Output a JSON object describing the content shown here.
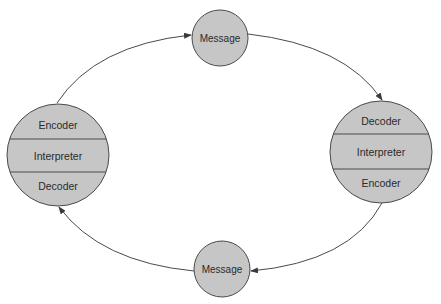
{
  "diagram": {
    "title": "",
    "colors": {
      "node_fill": "#c6c6c6",
      "stroke": "#4a4a4a",
      "text": "#2a2a2a",
      "background": "#ffffff"
    },
    "nodes": {
      "left_communicator": {
        "layers": [
          "Encoder",
          "Interpreter",
          "Decoder"
        ]
      },
      "right_communicator": {
        "layers": [
          "Decoder",
          "Interpreter",
          "Encoder"
        ]
      },
      "top_message": {
        "label": "Message"
      },
      "bottom_message": {
        "label": "Message"
      }
    },
    "edges": [
      {
        "from": "left_communicator",
        "to": "top_message"
      },
      {
        "from": "top_message",
        "to": "right_communicator"
      },
      {
        "from": "right_communicator",
        "to": "bottom_message"
      },
      {
        "from": "bottom_message",
        "to": "left_communicator"
      }
    ]
  }
}
